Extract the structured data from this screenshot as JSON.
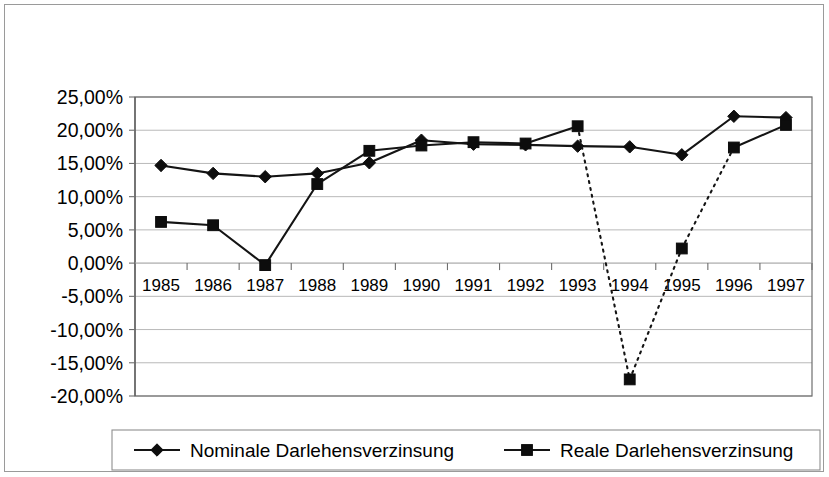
{
  "chart_data": {
    "type": "line",
    "title": "",
    "xlabel": "",
    "ylabel": "",
    "categories": [
      "1985",
      "1986",
      "1987",
      "1988",
      "1989",
      "1990",
      "1991",
      "1992",
      "1993",
      "1994",
      "1995",
      "1996",
      "1997"
    ],
    "ylim": [
      -20,
      25
    ],
    "ytick_step": 5,
    "ytick_labels": [
      "25,00%",
      "20,00%",
      "15,00%",
      "10,00%",
      "5,00%",
      "0,00%",
      "-5,00%",
      "-10,00%",
      "-15,00%",
      "-20,00%"
    ],
    "ytick_values": [
      25,
      20,
      15,
      10,
      5,
      0,
      -5,
      -10,
      -15,
      -20
    ],
    "grid": true,
    "legend_position": "bottom",
    "series": [
      {
        "name": "Nominale Darlehensverzinsung",
        "marker": "diamond",
        "line_style": "solid",
        "values": [
          14.7,
          13.5,
          13.0,
          13.5,
          15.1,
          18.5,
          17.9,
          17.8,
          17.6,
          17.5,
          16.3,
          22.1,
          21.9
        ]
      },
      {
        "name": "Reale Darlehensverzinsung",
        "marker": "square",
        "line_style": "solid",
        "dotted_from_index": 8,
        "dotted_to_index": 11,
        "values": [
          6.2,
          5.7,
          -0.3,
          11.9,
          16.9,
          17.7,
          18.2,
          18.0,
          20.6,
          -17.5,
          2.2,
          17.4,
          20.8
        ]
      }
    ]
  },
  "legend": {
    "items": [
      {
        "label": "Nominale Darlehensverzinsung",
        "marker": "diamond"
      },
      {
        "label": "Reale Darlehensverzinsung",
        "marker": "square"
      }
    ]
  }
}
